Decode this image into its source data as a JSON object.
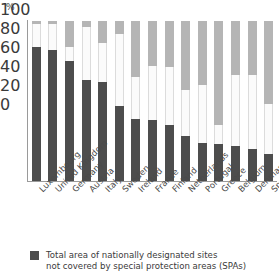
{
  "chart_data": {
    "type": "bar",
    "stacked": true,
    "title": "",
    "xlabel": "",
    "ylabel": "%",
    "ylim": [
      0,
      100
    ],
    "yticks": [
      0,
      20,
      40,
      60,
      80,
      100
    ],
    "grid": false,
    "legend_position": "bottom-left",
    "categories": [
      "Luxembourg",
      "United Kingdom",
      "Germany",
      "Austria",
      "Italy",
      "Sweden",
      "Ireland",
      "France",
      "Finland",
      "Netherlands",
      "Portugal",
      "Greece",
      "Belgium",
      "Denmark",
      "Spain"
    ],
    "series": [
      {
        "name": "Total area of nationally designated sites not covered by special protection areas (SPAs)",
        "color": "#4d4d4d",
        "values": [
          84,
          82,
          75,
          63,
          62,
          47,
          39,
          38,
          35,
          28,
          24,
          23,
          22,
          20,
          17
        ]
      },
      {
        "name": "middle-segment",
        "color": "#fbfbfb",
        "values": [
          14,
          16,
          9,
          33,
          24,
          45,
          26,
          34,
          36,
          29,
          36,
          12,
          44,
          46,
          31
        ]
      },
      {
        "name": "top-segment",
        "color": "#b5b5b5",
        "values": [
          2,
          2,
          16,
          4,
          14,
          8,
          35,
          28,
          29,
          43,
          40,
          65,
          34,
          34,
          52
        ]
      }
    ]
  },
  "legend": {
    "line1": "Total area of nationally designated sites",
    "line2": "not covered by special protection areas (SPAs)"
  },
  "axis": {
    "unit": "%",
    "tick_0": "0",
    "tick_20": "20",
    "tick_40": "40",
    "tick_60": "60",
    "tick_80": "80",
    "tick_100": "100"
  }
}
